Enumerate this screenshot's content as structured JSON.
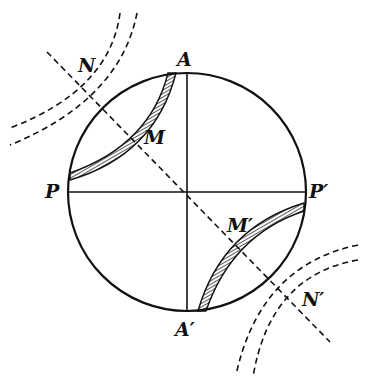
{
  "diagram": {
    "labels": {
      "A": "A",
      "A_prime": "A′",
      "P": "P",
      "P_prime": "P′",
      "M": "M",
      "M_prime": "M′",
      "N": "N",
      "N_prime": "N′"
    },
    "colors": {
      "ink": "#111111",
      "background": "#ffffff"
    }
  }
}
